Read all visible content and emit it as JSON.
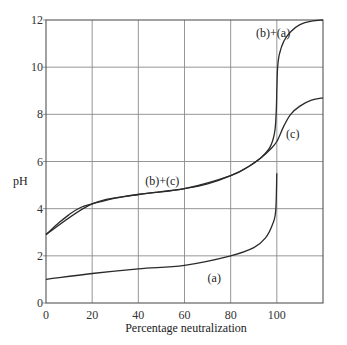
{
  "chart_data": {
    "type": "line",
    "title": "",
    "xlabel": "Percentage neutralization",
    "ylabel": "pH",
    "xlim": [
      0,
      120
    ],
    "ylim": [
      0,
      12
    ],
    "grid": true,
    "x_ticks": [
      "0",
      "20",
      "40",
      "60",
      "80",
      "100"
    ],
    "y_ticks": [
      "0",
      "2",
      "4",
      "6",
      "8",
      "10",
      "12"
    ],
    "legend": null,
    "series": [
      {
        "name": "(a)",
        "x": [
          0,
          20,
          40,
          60,
          80,
          90,
          95,
          98,
          99.5,
          100
        ],
        "y": [
          1.0,
          1.25,
          1.45,
          1.6,
          2.0,
          2.35,
          2.75,
          3.3,
          3.9,
          5.5
        ]
      },
      {
        "name": "(b)+(c)",
        "x": [
          0,
          5,
          10,
          15,
          20,
          30,
          40,
          50,
          60,
          70,
          80,
          88,
          93,
          97,
          100,
          103,
          106,
          110,
          115,
          120
        ],
        "y": [
          2.9,
          3.35,
          3.75,
          4.05,
          4.2,
          4.45,
          4.6,
          4.72,
          4.85,
          5.05,
          5.4,
          5.8,
          6.15,
          6.5,
          6.85,
          7.5,
          8.0,
          8.35,
          8.6,
          8.7
        ]
      },
      {
        "name": "(b)+(a)",
        "x": [
          0,
          20,
          40,
          60,
          80,
          88,
          93,
          97,
          99,
          99.7,
          100,
          100.3,
          101,
          103,
          106,
          110,
          115,
          120
        ],
        "y": [
          2.9,
          4.2,
          4.6,
          4.85,
          5.4,
          5.8,
          6.15,
          6.6,
          7.2,
          8.0,
          9.0,
          9.9,
          10.5,
          11.1,
          11.5,
          11.8,
          11.95,
          12.0
        ]
      }
    ],
    "annotations": [
      {
        "text": "(b)+(a)",
        "x": 91,
        "y": 11.3
      },
      {
        "text": "(c)",
        "x": 104,
        "y": 7.0
      },
      {
        "text": "(b)+(c)",
        "x": 43,
        "y": 5.0
      },
      {
        "text": "(a)",
        "x": 70,
        "y": 0.9
      }
    ]
  }
}
